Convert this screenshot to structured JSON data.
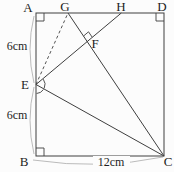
{
  "diagram": {
    "type": "geometry-figure",
    "figure": "square ABCD with fold construction lines",
    "colors": {
      "background": "#fcfcfc",
      "line": "#3f3f3f",
      "brace": "#b3b3b3",
      "text": "#1e1e1e"
    },
    "vertices": {
      "A": "A",
      "B": "B",
      "C": "C",
      "D": "D",
      "E": "E",
      "F": "F",
      "G": "G",
      "H": "H"
    },
    "measurements": {
      "segment_AE": "6cm",
      "segment_EB": "6cm",
      "segment_BC": "12cm"
    },
    "segments": [
      {
        "from": "A",
        "to": "D",
        "style": "solid"
      },
      {
        "from": "D",
        "to": "C",
        "style": "solid"
      },
      {
        "from": "B",
        "to": "C",
        "style": "solid"
      },
      {
        "from": "A",
        "to": "B",
        "style": "solid"
      },
      {
        "from": "E",
        "to": "H",
        "style": "solid",
        "through": "F"
      },
      {
        "from": "G",
        "to": "C",
        "style": "solid",
        "through": "F"
      },
      {
        "from": "E",
        "to": "C",
        "style": "solid"
      },
      {
        "from": "E",
        "to": "G",
        "style": "dashed"
      }
    ],
    "right_angle_marks": [
      "A",
      "B",
      "D",
      "F"
    ],
    "equal_angle_arcs_at": "E"
  }
}
